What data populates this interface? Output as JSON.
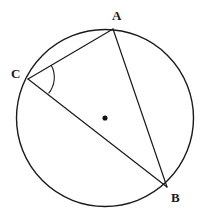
{
  "figure": {
    "type": "geometry-diagram",
    "background_color": "#ffffff",
    "stroke_color": "#1a1a1a",
    "width": 206,
    "height": 222
  },
  "circle": {
    "name": "circumscribed-circle",
    "center_x": 105,
    "center_y": 118,
    "radius": 88.5,
    "stroke_width": 1.4,
    "fill": "none"
  },
  "center_point": {
    "name": "circle-center-dot",
    "x": 105,
    "y": 118,
    "size": 3.2,
    "color": "#111111",
    "label": ""
  },
  "points": [
    {
      "id": "A",
      "label": "A",
      "x": 113,
      "y": 29,
      "label_x": 112,
      "label_y": 9
    },
    {
      "id": "C",
      "label": "C",
      "x": 28,
      "y": 79,
      "label_x": 11,
      "label_y": 67
    },
    {
      "id": "B",
      "label": "B",
      "x": 167,
      "y": 187,
      "label_x": 171,
      "label_y": 191
    }
  ],
  "chords": [
    {
      "id": "CA",
      "from": "C",
      "to": "A",
      "x1": 28,
      "y1": 79,
      "x2": 113,
      "y2": 29,
      "stroke_width": 1.2
    },
    {
      "id": "CB",
      "from": "C",
      "to": "B",
      "x1": 28,
      "y1": 79,
      "x2": 167,
      "y2": 187,
      "stroke_width": 1.2
    },
    {
      "id": "AB",
      "from": "A",
      "to": "B",
      "x1": 113,
      "y1": 29,
      "x2": 167,
      "y2": 187,
      "stroke_width": 1.2
    }
  ],
  "angle_marker": {
    "name": "inscribed-angle-arc-at-C",
    "vertex": "C",
    "radius": 25,
    "path": "M 51.2 65.3 A 25 25 0 0 1 48.6 93.3",
    "stroke_width": 1.1,
    "measure_label": ""
  }
}
